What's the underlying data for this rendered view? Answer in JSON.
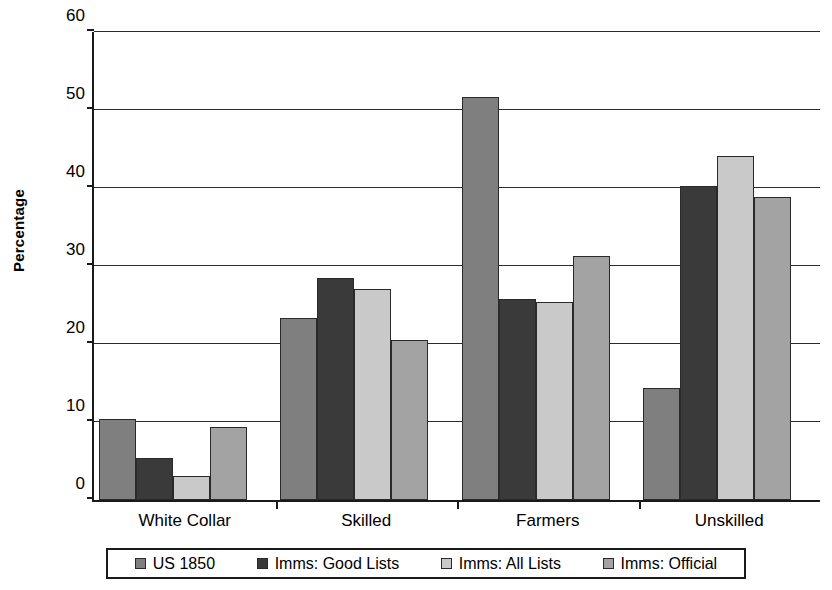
{
  "chart_data": {
    "type": "bar",
    "title": "",
    "subtitle": "",
    "xlabel": "",
    "ylabel": "Percentage",
    "ylim": [
      0,
      60
    ],
    "yticks": [
      0,
      10,
      20,
      30,
      40,
      50,
      60
    ],
    "ytick_labels": [
      "0",
      "10",
      "20",
      "30",
      "40",
      "50",
      "60"
    ],
    "grid": true,
    "legend_position": "bottom",
    "categories": [
      "White Collar",
      "Skilled",
      "Farmers",
      "Unskilled"
    ],
    "series": [
      {
        "name": "US 1850",
        "color": "#7f7f7f",
        "values": [
          10.4,
          23.3,
          51.7,
          14.3
        ]
      },
      {
        "name": "Imms: Good Lists",
        "color": "#3a3a3a",
        "values": [
          5.4,
          28.4,
          25.8,
          40.3
        ]
      },
      {
        "name": "Imms: All Lists",
        "color": "#c9c9c9",
        "values": [
          3.1,
          27.0,
          25.4,
          44.1
        ]
      },
      {
        "name": "Imms: Official",
        "color": "#a3a3a3",
        "values": [
          9.3,
          20.5,
          31.3,
          38.8
        ]
      }
    ]
  },
  "axis": {
    "y_title": "Percentage"
  },
  "colors": {
    "axis": "#1a1a1a",
    "gridline": "#2b2b2b",
    "bar_outline": "#2a2a2a",
    "background": "#ffffff"
  }
}
